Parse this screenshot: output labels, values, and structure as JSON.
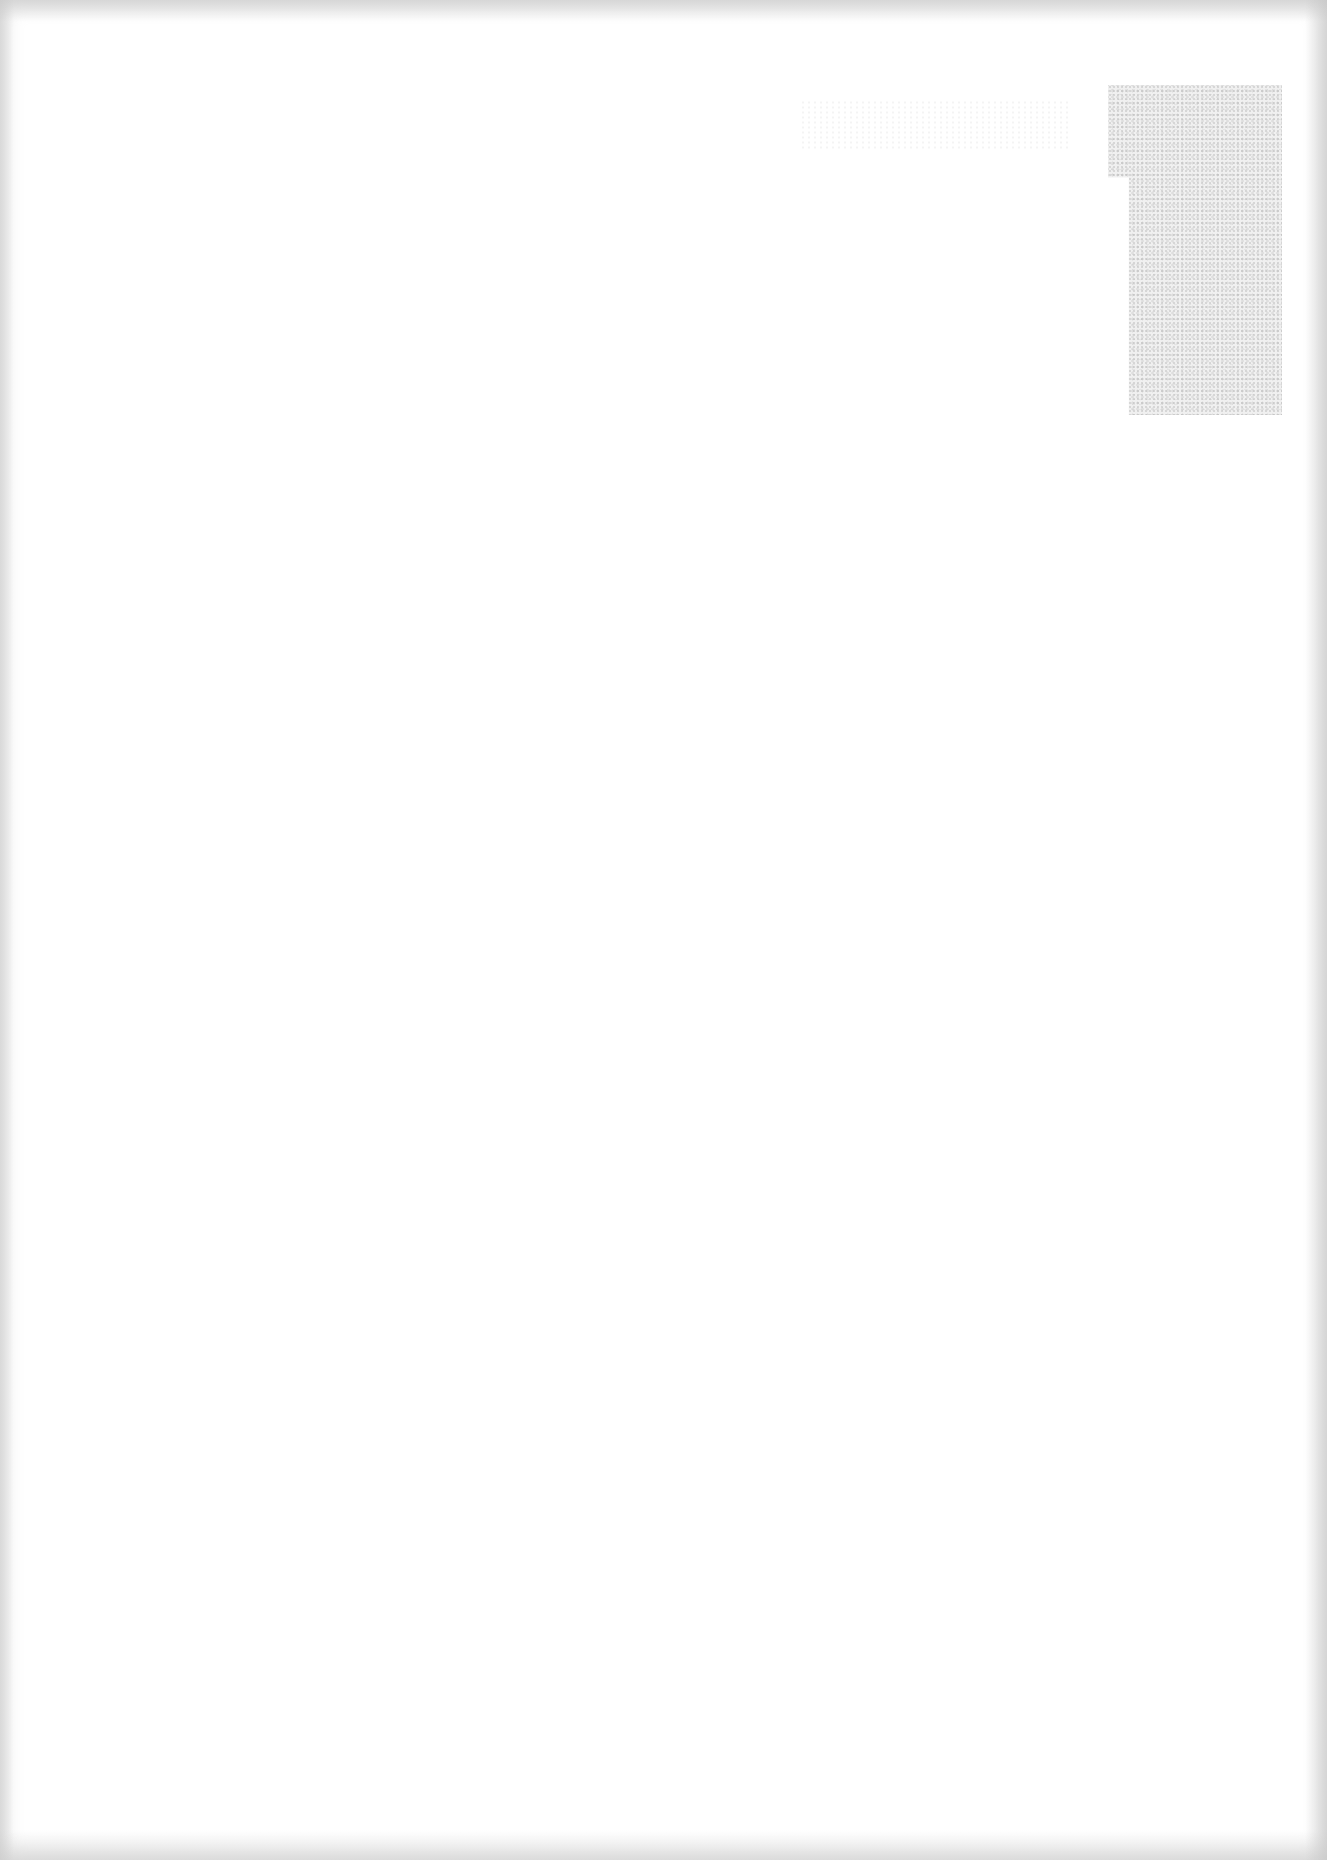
{
  "document": {
    "type": "blank scanned page",
    "visible_text": [],
    "colors": {
      "paper": "#ffffff",
      "edge_shading": "#c8c8c8",
      "bleed_patch": "#e6e6e6"
    }
  }
}
